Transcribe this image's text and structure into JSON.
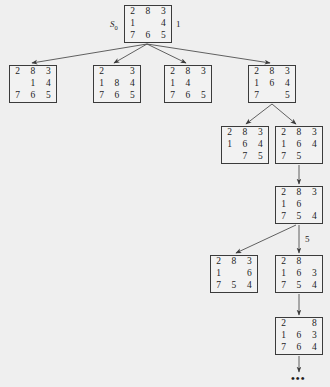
{
  "figure": {
    "type": "search-tree",
    "background_color": "#efefef",
    "node_border_color": "#3b3b3b",
    "edge_color": "#3b3b3b",
    "blank_symbol": ""
  },
  "labels": {
    "root_name": "S",
    "root_subscript": "0",
    "root_cost": "1",
    "edge_cost_level4": "5",
    "continuation": "•••"
  },
  "nodes": [
    {
      "id": "n0",
      "name": "root-state",
      "grid": [
        [
          "2",
          "8",
          "3"
        ],
        [
          "1",
          "",
          "4"
        ],
        [
          "7",
          "6",
          "5"
        ]
      ],
      "x": 124,
      "y": 5,
      "w": 48,
      "h": 38
    },
    {
      "id": "n1",
      "name": "child-state-1",
      "grid": [
        [
          "2",
          "8",
          "3"
        ],
        [
          "",
          "1",
          "4"
        ],
        [
          "7",
          "6",
          "5"
        ]
      ],
      "x": 9,
      "y": 65,
      "w": 48,
      "h": 38
    },
    {
      "id": "n2",
      "name": "child-state-2",
      "grid": [
        [
          "2",
          "",
          "3"
        ],
        [
          "1",
          "8",
          "4"
        ],
        [
          "7",
          "6",
          "5"
        ]
      ],
      "x": 93,
      "y": 65,
      "w": 48,
      "h": 38
    },
    {
      "id": "n3",
      "name": "child-state-3",
      "grid": [
        [
          "2",
          "8",
          "3"
        ],
        [
          "1",
          "4",
          ""
        ],
        [
          "7",
          "6",
          "5"
        ]
      ],
      "x": 164,
      "y": 65,
      "w": 48,
      "h": 38
    },
    {
      "id": "n4",
      "name": "child-state-4",
      "grid": [
        [
          "2",
          "8",
          "3"
        ],
        [
          "1",
          "6",
          "4"
        ],
        [
          "7",
          "",
          "5"
        ]
      ],
      "x": 248,
      "y": 65,
      "w": 48,
      "h": 38
    },
    {
      "id": "n5",
      "name": "level3-state-left",
      "grid": [
        [
          "2",
          "8",
          "3"
        ],
        [
          "1",
          "6",
          "4"
        ],
        [
          "",
          "7",
          "5"
        ]
      ],
      "x": 221,
      "y": 126,
      "w": 48,
      "h": 38
    },
    {
      "id": "n6",
      "name": "level3-state-right",
      "grid": [
        [
          "2",
          "8",
          "3"
        ],
        [
          "1",
          "6",
          "4"
        ],
        [
          "7",
          "5",
          ""
        ]
      ],
      "x": 275,
      "y": 126,
      "w": 48,
      "h": 38
    },
    {
      "id": "n7",
      "name": "level4-state",
      "grid": [
        [
          "2",
          "8",
          "3"
        ],
        [
          "1",
          "6",
          ""
        ],
        [
          "7",
          "5",
          "4"
        ]
      ],
      "x": 275,
      "y": 186,
      "w": 48,
      "h": 38
    },
    {
      "id": "n8",
      "name": "level5-state-left",
      "grid": [
        [
          "2",
          "8",
          "3"
        ],
        [
          "1",
          "",
          "6"
        ],
        [
          "7",
          "5",
          "4"
        ]
      ],
      "x": 210,
      "y": 255,
      "w": 48,
      "h": 38
    },
    {
      "id": "n9",
      "name": "level5-state-right",
      "grid": [
        [
          "2",
          "8",
          ""
        ],
        [
          "1",
          "6",
          "3"
        ],
        [
          "7",
          "5",
          "4"
        ]
      ],
      "x": 275,
      "y": 255,
      "w": 48,
      "h": 38
    },
    {
      "id": "n10",
      "name": "level6-state",
      "grid": [
        [
          "2",
          "",
          "8"
        ],
        [
          "1",
          "6",
          "3"
        ],
        [
          "7",
          "6",
          "4"
        ]
      ],
      "x": 275,
      "y": 317,
      "w": 48,
      "h": 38
    }
  ],
  "edges": [
    {
      "name": "edge-root-to-child1",
      "from": "n0",
      "to": "n1"
    },
    {
      "name": "edge-root-to-child2",
      "from": "n0",
      "to": "n2"
    },
    {
      "name": "edge-root-to-child3",
      "from": "n0",
      "to": "n3"
    },
    {
      "name": "edge-root-to-child4",
      "from": "n0",
      "to": "n4"
    },
    {
      "name": "edge-child4-to-level3-left",
      "from": "n4",
      "to": "n5"
    },
    {
      "name": "edge-child4-to-level3-right",
      "from": "n4",
      "to": "n6"
    },
    {
      "name": "edge-level3-right-to-level4",
      "from": "n6",
      "to": "n7"
    },
    {
      "name": "edge-level4-to-level5-left",
      "from": "n7",
      "to": "n8"
    },
    {
      "name": "edge-level4-to-level5-right",
      "from": "n7",
      "to": "n9"
    },
    {
      "name": "edge-level5-right-to-level6",
      "from": "n9",
      "to": "n10"
    },
    {
      "name": "edge-level6-to-continuation",
      "from": "n10",
      "to": "dots"
    }
  ]
}
